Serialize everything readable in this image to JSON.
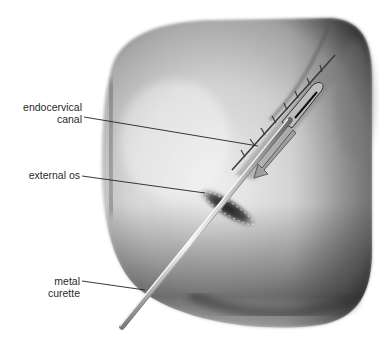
{
  "figure": {
    "labels": [
      {
        "id": "endocervical-canal",
        "lines": [
          "endocervical",
          "canal"
        ]
      },
      {
        "id": "external-os",
        "lines": [
          "external os"
        ]
      },
      {
        "id": "metal-curette",
        "lines": [
          "metal",
          "curette"
        ]
      }
    ]
  },
  "colors": {
    "background": "#ffffff",
    "tissue_light": "#e6e6e6",
    "tissue_mid": "#bdbdbd",
    "tissue_dark": "#3a3a3a",
    "instrument": "#d9d9d9",
    "leader_line": "#222222",
    "label_text": "#2b2b2b"
  }
}
